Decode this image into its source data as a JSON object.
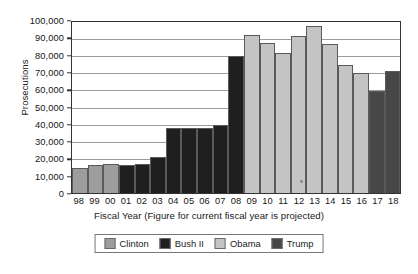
{
  "chart_data": {
    "type": "bar",
    "title": "",
    "xlabel": "Fiscal Year (Figure for current fiscal year is projected)",
    "ylabel": "Prosecutions",
    "ylim": [
      0,
      100000
    ],
    "ytick_values": [
      0,
      10000,
      20000,
      30000,
      40000,
      50000,
      60000,
      70000,
      80000,
      90000,
      100000
    ],
    "ytick_labels": [
      "0",
      "10,000",
      "20,000",
      "30,000",
      "40,000",
      "50,000",
      "60,000",
      "70,000",
      "80,000",
      "90,000",
      "100,000"
    ],
    "grid": true,
    "legend_position": "bottom-center",
    "categories": [
      "98",
      "99",
      "00",
      "01",
      "02",
      "03",
      "04",
      "05",
      "06",
      "07",
      "08",
      "09",
      "10",
      "11",
      "12",
      "13",
      "14",
      "15",
      "16",
      "17",
      "18"
    ],
    "values": [
      14500,
      16200,
      17000,
      16500,
      17200,
      21000,
      38000,
      37800,
      37800,
      39500,
      80000,
      92500,
      87500,
      82000,
      92000,
      97500,
      87000,
      75000,
      70000,
      59500,
      71500
    ],
    "bar_groups": [
      "Clinton",
      "Clinton",
      "Clinton",
      "Bush II",
      "Bush II",
      "Bush II",
      "Bush II",
      "Bush II",
      "Bush II",
      "Bush II",
      "Bush II",
      "Obama",
      "Obama",
      "Obama",
      "Obama",
      "Obama",
      "Obama",
      "Obama",
      "Obama",
      "Trump",
      "Trump"
    ],
    "legend": [
      {
        "name": "Clinton",
        "color": "#9d9d9d"
      },
      {
        "name": "Bush II",
        "color": "#1f1f1f"
      },
      {
        "name": "Obama",
        "color": "#c4c4c4"
      },
      {
        "name": "Trump",
        "color": "#474747"
      }
    ]
  },
  "caption": ""
}
